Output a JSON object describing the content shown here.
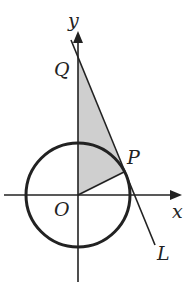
{
  "diagram": {
    "title": "",
    "labels": {
      "y_axis": "y",
      "x_axis": "x",
      "origin": "O",
      "point_q": "Q",
      "point_p": "P",
      "line": "L"
    },
    "geometry": {
      "origin": [
        78,
        195
      ],
      "circle_radius": 52,
      "point_q": [
        78,
        57
      ],
      "point_p": [
        124,
        172
      ],
      "tangent_line_start": [
        71,
        40
      ],
      "tangent_line_end": [
        155,
        245
      ],
      "shaded_region": "area between segment OQ, line QP, and segment OP (triangle OQP)"
    },
    "colors": {
      "stroke": "#222222",
      "shade": "#cfcfcf",
      "background": "#ffffff"
    }
  }
}
